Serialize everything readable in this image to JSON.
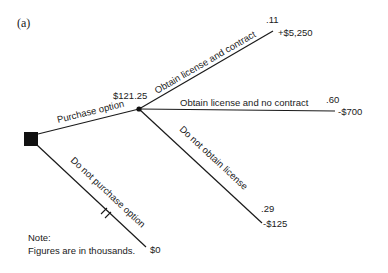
{
  "figure_label": "(a)",
  "nodes": {
    "decision": {
      "type": "decision-square"
    },
    "chance": {
      "type": "chance-dot",
      "expected_value": "$121.25"
    }
  },
  "branches": {
    "purchase": {
      "label": "Purchase option"
    },
    "not_purchase": {
      "label": "Do not purchase option",
      "payoff": "$0"
    },
    "license_contract": {
      "label": "Obtain license and contract",
      "probability": ".11",
      "payoff": "+$5,250"
    },
    "license_no_contract": {
      "label": "Obtain license and no contract",
      "probability": ".60",
      "payoff": "-$700"
    },
    "no_license": {
      "label": "Do not obtain license",
      "probability": ".29",
      "payoff": "-$125"
    }
  },
  "note": {
    "title": "Note:",
    "text": "Figures are in thousands."
  }
}
